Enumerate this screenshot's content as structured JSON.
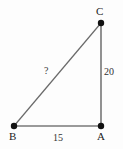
{
  "diagram": {
    "type": "right-triangle",
    "background_color": "#fdfdfd",
    "vertices": [
      {
        "id": "C",
        "label": "C",
        "x": 101,
        "y": 23
      },
      {
        "id": "A",
        "label": "A",
        "x": 101,
        "y": 126
      },
      {
        "id": "B",
        "label": "B",
        "x": 14,
        "y": 126
      }
    ],
    "sides": [
      {
        "id": "vertical-leg-CA",
        "from": "C",
        "to": "A",
        "label": "20",
        "color": "#4a4a4a"
      },
      {
        "id": "base-leg-BA",
        "from": "B",
        "to": "A",
        "label": "15",
        "color": "#9a9a9a"
      },
      {
        "id": "hypotenuse-BC",
        "from": "B",
        "to": "C",
        "label": "?",
        "color": "#6a6a6a"
      }
    ],
    "vertex_dot_color": "#111111",
    "vertex_dot_radius": 3
  }
}
